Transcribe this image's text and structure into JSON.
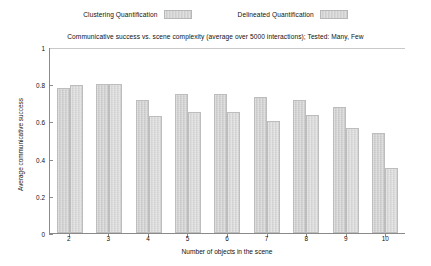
{
  "chart_data": {
    "type": "bar",
    "title": "Communicative success vs. scene complexity (average over 5000 interactions); Tested: Many, Few",
    "xlabel": "Number of objects in the scene",
    "ylabel": "Average communicative success",
    "categories": [
      "2",
      "3",
      "4",
      "5",
      "6",
      "7",
      "8",
      "9",
      "10"
    ],
    "series": [
      {
        "name": "Clustering Quantification",
        "values": [
          0.78,
          0.8,
          0.715,
          0.75,
          0.745,
          0.73,
          0.715,
          0.68,
          0.54
        ]
      },
      {
        "name": "Delineated Quantification",
        "values": [
          0.795,
          0.8,
          0.63,
          0.65,
          0.65,
          0.6,
          0.635,
          0.565,
          0.35
        ]
      }
    ],
    "ylim": [
      0,
      1
    ],
    "yticks": [
      "0",
      "0.2",
      "0.4",
      "0.6",
      "0.8",
      "1"
    ],
    "ytick_values": [
      0,
      0.2,
      0.4,
      0.6,
      0.8,
      1
    ],
    "grid": false,
    "legend_position": "top-center"
  },
  "legend": {
    "entries": [
      {
        "label": "Clustering Quantification"
      },
      {
        "label": "Delineated Quantification"
      }
    ]
  },
  "colors": {
    "bar_fill": "#d2d2d2",
    "bar_fill_b": "#d8d8d8",
    "bar_border": "#bdbdbd",
    "axis": "#8a8a8a",
    "text": "#111111",
    "background": "#ffffff"
  }
}
